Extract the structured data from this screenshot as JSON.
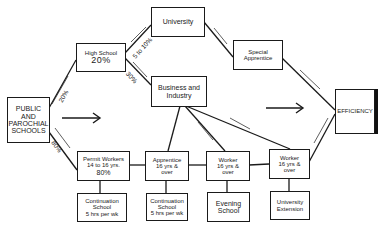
{
  "diagram": {
    "nodes": {
      "schools": {
        "line1": "PUBLIC AND",
        "line2": "PAROCHIAL",
        "line3": "SCHOOLS"
      },
      "high_school": {
        "line1": "High School",
        "line2": "20%"
      },
      "university": {
        "line1": "University"
      },
      "special_apprentice": {
        "line1": "Special",
        "line2": "Apprentice"
      },
      "business": {
        "line1": "Business and",
        "line2": "Industry"
      },
      "efficiency": {
        "line1": "EFFICIENCY"
      },
      "permit_workers": {
        "line1": "Permit Workers",
        "line2": "14 to 16 yrs.",
        "line3": "80%"
      },
      "apprentice": {
        "line1": "Apprentice",
        "line2": "16 yrs &",
        "line3": "over"
      },
      "worker1": {
        "line1": "Worker",
        "line2": "16 yrs &",
        "line3": "over"
      },
      "worker2": {
        "line1": "Worker",
        "line2": "16 yrs &",
        "line3": "over"
      },
      "continuation1": {
        "line1": "Continuation",
        "line2": "School",
        "line3": "5 hrs per wk"
      },
      "continuation2": {
        "line1": "Continuation",
        "line2": "School",
        "line3": "5 hrs per wk"
      },
      "evening": {
        "line1": "Evening",
        "line2": "School"
      },
      "extension": {
        "line1": "University",
        "line2": "Extension"
      }
    },
    "edge_labels": {
      "schools_to_hs": "20%",
      "schools_to_permit": "80%",
      "hs_to_univ": "5 to 10%",
      "hs_to_business": "30%",
      "to": "to"
    }
  }
}
